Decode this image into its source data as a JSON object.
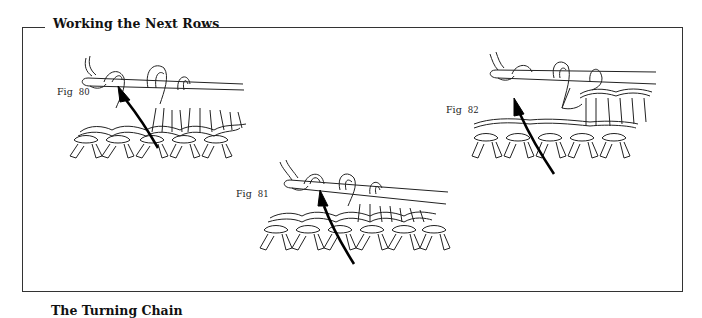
{
  "section": {
    "title": "Working the Next Rows"
  },
  "figures": [
    {
      "id": "fig80",
      "label": "Fig",
      "number": "80",
      "description": "Hook inserted into stitch, yarn over, arrow showing direction"
    },
    {
      "id": "fig81",
      "label": "Fig",
      "number": "81",
      "description": "Hook inserted into next stitch, arrow showing direction"
    },
    {
      "id": "fig82",
      "label": "Fig",
      "number": "82",
      "description": "Loops on hook, arrow showing direction"
    }
  ],
  "next_section": {
    "title": "The Turning Chain"
  },
  "colors": {
    "ink": "#111111",
    "frame": "#333333",
    "background": "#ffffff"
  }
}
